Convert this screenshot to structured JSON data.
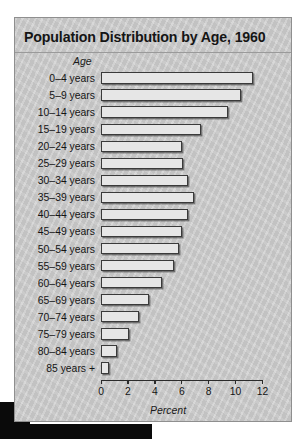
{
  "chart_data": {
    "type": "bar",
    "orientation": "horizontal",
    "title": "Population Distribution by Age, 1960",
    "xlabel": "Percent",
    "ylabel": "Age",
    "xlim": [
      0,
      12
    ],
    "xticks": [
      0,
      2,
      4,
      6,
      8,
      10,
      12
    ],
    "xtick_labels": [
      "0",
      "2",
      "4",
      "6",
      "8",
      "10",
      "12"
    ],
    "grid": false,
    "legend": false,
    "categories": [
      "0–4 years",
      "5–9 years",
      "10–14 years",
      "15–19 years",
      "20–24 years",
      "25–29 years",
      "30–34 years",
      "35–39 years",
      "40–44 years",
      "45–49 years",
      "50–54 years",
      "55–59 years",
      "60–64 years",
      "65–69 years",
      "70–74 years",
      "75–79 years",
      "80–84 years",
      "85 years +"
    ],
    "values": [
      11.3,
      10.4,
      9.4,
      7.4,
      6.0,
      6.1,
      6.5,
      6.9,
      6.5,
      6.0,
      5.8,
      5.4,
      4.5,
      3.6,
      2.8,
      2.1,
      1.2,
      0.6
    ],
    "bar_face_color": "#e6e6e6",
    "bar_edge_color": "#3a3a3a",
    "panel_background": "#c9c9c9"
  }
}
